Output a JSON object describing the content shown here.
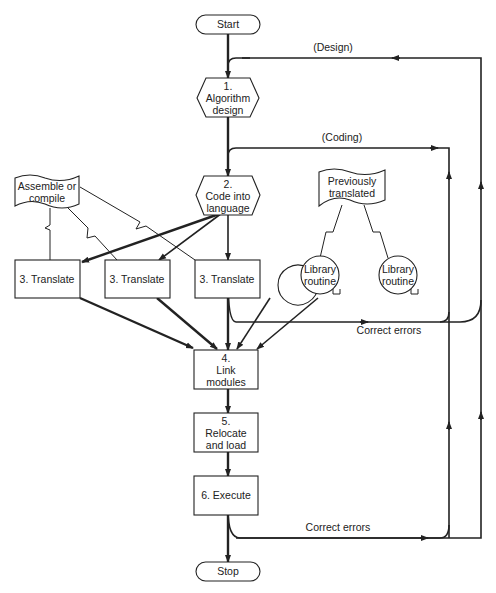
{
  "diagram": {
    "type": "flowchart",
    "nodes": {
      "start": {
        "label": "Start"
      },
      "algorithm": {
        "num": "1.",
        "line1": "Algorithm",
        "line2": "design"
      },
      "code": {
        "num": "2.",
        "line1": "Code into",
        "line2": "language"
      },
      "assemble": {
        "line1": "Assemble or",
        "line2": "compile"
      },
      "previously": {
        "line1": "Previously",
        "line2": "translated"
      },
      "translate1": {
        "label": "3.  Translate"
      },
      "translate2": {
        "label": "3.  Translate"
      },
      "translate3": {
        "label": "3.  Translate"
      },
      "library1": {
        "line1": "Library",
        "line2": "routine"
      },
      "library2": {
        "line1": "Library",
        "line2": "routine"
      },
      "link": {
        "num": "4.",
        "line1": "Link",
        "line2": "modules"
      },
      "relocate": {
        "num": "5.",
        "line1": "Relocate",
        "line2": "and load"
      },
      "execute": {
        "label": "6.  Execute"
      },
      "stop": {
        "label": "Stop"
      }
    },
    "labels": {
      "design_loop": "(Design)",
      "coding_loop": "(Coding)",
      "correct_errors_mid": "Correct errors",
      "correct_errors_bottom": "Correct errors"
    },
    "edges": [
      {
        "from": "start",
        "to": "algorithm"
      },
      {
        "from": "algorithm",
        "to": "code"
      },
      {
        "from": "code",
        "to": "translate1"
      },
      {
        "from": "code",
        "to": "translate2"
      },
      {
        "from": "code",
        "to": "translate3"
      },
      {
        "from": "translate1",
        "to": "link"
      },
      {
        "from": "translate2",
        "to": "link"
      },
      {
        "from": "translate3",
        "to": "link"
      },
      {
        "from": "library1",
        "to": "link"
      },
      {
        "from": "library2",
        "to": "link"
      },
      {
        "from": "link",
        "to": "relocate"
      },
      {
        "from": "relocate",
        "to": "execute"
      },
      {
        "from": "execute",
        "to": "stop"
      },
      {
        "from": "execute",
        "to": "algorithm",
        "label": "Correct errors / (Design)"
      },
      {
        "from": "execute",
        "to": "code",
        "label": "Correct errors / (Coding)"
      },
      {
        "from": "translate3",
        "to": "algorithm",
        "label": "Correct errors / (Design)"
      },
      {
        "from": "translate3",
        "to": "code",
        "label": "Correct errors / (Coding)"
      }
    ],
    "colors": {
      "ink": "#222222",
      "background": "#ffffff"
    }
  }
}
